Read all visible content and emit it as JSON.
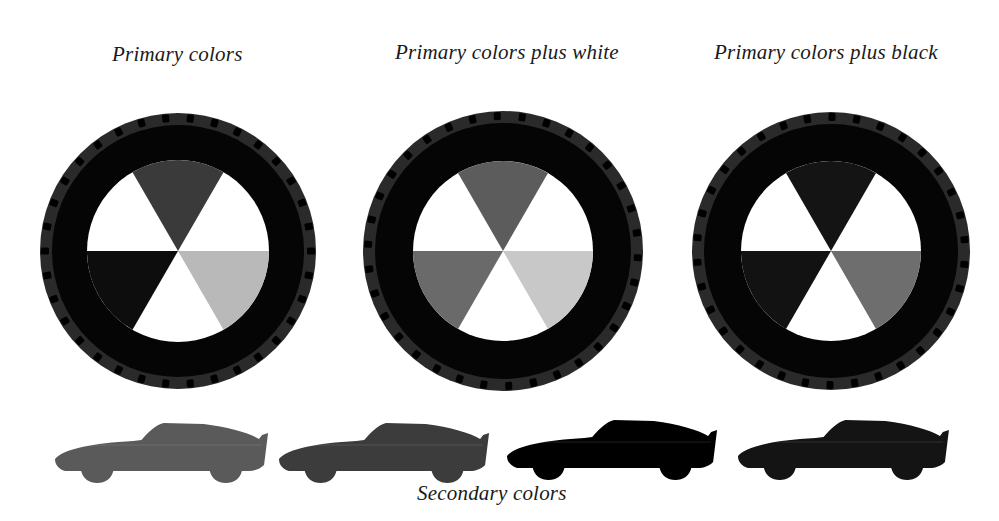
{
  "title_captions": {
    "wheel_1": "Primary colors",
    "wheel_2": "Primary colors plus white",
    "wheel_3": "Primary colors plus black"
  },
  "bottom_caption": "Secondary colors",
  "wheels": [
    {
      "name": "primary-colors",
      "cx": 178,
      "cy": 251,
      "r_outer": 138,
      "r_inner": 91,
      "tire_color": "#050505",
      "tread_color": "#2a2a2a",
      "wedges": {
        "top": "#3a3a3a",
        "lower_left": "#0d0d0d",
        "lower_right": "#b9b9b9"
      }
    },
    {
      "name": "primary-colors-plus-white",
      "cx": 503,
      "cy": 251,
      "r_outer": 140,
      "r_inner": 90,
      "tire_color": "#050505",
      "tread_color": "#2a2a2a",
      "wedges": {
        "top": "#5c5c5c",
        "lower_left": "#6a6a6a",
        "lower_right": "#c8c8c8"
      }
    },
    {
      "name": "primary-colors-plus-black",
      "cx": 831,
      "cy": 251,
      "r_outer": 139,
      "r_inner": 90,
      "tire_color": "#050505",
      "tread_color": "#2a2a2a",
      "wedges": {
        "top": "#141414",
        "lower_left": "#121212",
        "lower_right": "#6e6e6e"
      }
    }
  ],
  "cars": [
    {
      "name": "car-1",
      "color": "#5a5a5a"
    },
    {
      "name": "car-2",
      "color": "#3c3c3c"
    },
    {
      "name": "car-3",
      "color": "#000000"
    },
    {
      "name": "car-4",
      "color": "#141414"
    }
  ]
}
